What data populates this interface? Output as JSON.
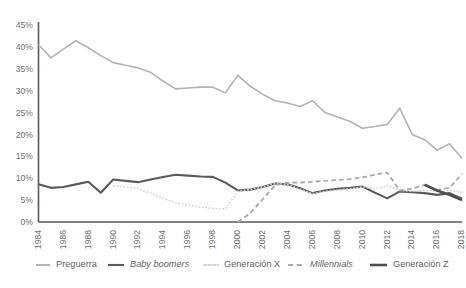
{
  "chart_data": {
    "type": "line",
    "title": "",
    "subtitle": "",
    "xlabel": "",
    "ylabel": "",
    "xlim": [
      1984,
      2018
    ],
    "ylim": [
      0,
      45
    ],
    "grid": false,
    "legend_position": "bottom",
    "y_ticks": [
      "0%",
      "5%",
      "10%",
      "15%",
      "20%",
      "25%",
      "30%",
      "35%",
      "40%",
      "45%"
    ],
    "y_tick_values": [
      0,
      5,
      10,
      15,
      20,
      25,
      30,
      35,
      40,
      45
    ],
    "x_ticks": [
      "1984",
      "1986",
      "1988",
      "1990",
      "1992",
      "1994",
      "1996",
      "1998",
      "2000",
      "2002",
      "2004",
      "2006",
      "2008",
      "2010",
      "2012",
      "2014",
      "2016",
      "2018"
    ],
    "x_tick_values": [
      1984,
      1986,
      1988,
      1990,
      1992,
      1994,
      1996,
      1998,
      2000,
      2002,
      2004,
      2006,
      2008,
      2010,
      2012,
      2014,
      2016,
      2018
    ],
    "series": [
      {
        "name": "Preguerra",
        "color": "#b3b3b3",
        "style": "solid",
        "width": 1.6,
        "italic": false,
        "x": [
          1984,
          1985,
          1986,
          1987,
          1988,
          1989,
          1990,
          1991,
          1992,
          1993,
          1994,
          1995,
          1996,
          1997,
          1998,
          1999,
          2000,
          2001,
          2002,
          2003,
          2004,
          2005,
          2006,
          2007,
          2008,
          2009,
          2010,
          2011,
          2012,
          2013,
          2014,
          2015,
          2016,
          2017,
          2018
        ],
        "values": [
          40.5,
          37.5,
          39.5,
          41.4,
          39.8,
          38.0,
          36.4,
          35.8,
          35.2,
          34.2,
          32.2,
          30.4,
          30.6,
          30.8,
          30.8,
          29.5,
          33.5,
          31.0,
          29.2,
          27.7,
          27.2,
          26.4,
          27.7,
          25.0,
          24.0,
          23.0,
          21.4,
          21.8,
          22.3,
          26.0,
          20.0,
          18.8,
          16.4,
          17.9,
          14.5
        ]
      },
      {
        "name": "Baby boomers",
        "color": "#5a5a5a",
        "style": "solid",
        "width": 2.1,
        "italic": true,
        "x": [
          1984,
          1985,
          1986,
          1987,
          1988,
          1989,
          1990,
          1991,
          1992,
          1993,
          1994,
          1995,
          1996,
          1997,
          1998,
          1999,
          2000,
          2001,
          2002,
          2003,
          2004,
          2005,
          2006,
          2007,
          2008,
          2009,
          2010,
          2011,
          2012,
          2013,
          2014,
          2015,
          2016,
          2017,
          2018
        ],
        "values": [
          8.6,
          7.8,
          8.0,
          8.6,
          9.2,
          6.7,
          9.7,
          9.4,
          9.1,
          9.7,
          10.3,
          10.8,
          10.6,
          10.4,
          10.3,
          9.0,
          7.2,
          7.4,
          8.0,
          8.8,
          8.6,
          7.7,
          6.6,
          7.2,
          7.6,
          7.8,
          8.1,
          6.7,
          5.4,
          7.0,
          6.8,
          6.6,
          6.2,
          6.6,
          5.3
        ]
      },
      {
        "name": "Generación X",
        "color": "#d2d2d2",
        "style": "dotted",
        "width": 1.5,
        "italic": false,
        "x": [
          1990,
          1991,
          1992,
          1993,
          1994,
          1995,
          1996,
          1997,
          1998,
          1999,
          2000,
          2001,
          2002,
          2003,
          2004,
          2005,
          2006,
          2007,
          2008,
          2009,
          2010,
          2011,
          2012,
          2013,
          2014,
          2015,
          2016,
          2017,
          2018
        ],
        "values": [
          8.3,
          8.0,
          7.6,
          6.6,
          5.4,
          4.4,
          3.9,
          3.4,
          3.1,
          3.0,
          7.0,
          7.4,
          8.0,
          8.8,
          8.6,
          7.5,
          6.5,
          7.0,
          7.3,
          7.6,
          8.0,
          7.6,
          8.3,
          7.2,
          7.0,
          7.2,
          7.0,
          7.2,
          6.8
        ]
      },
      {
        "name": "Millennials",
        "color": "#a8a8a8",
        "style": "dashed",
        "width": 1.8,
        "italic": true,
        "x": [
          2000,
          2001,
          2002,
          2003,
          2004,
          2005,
          2006,
          2007,
          2008,
          2009,
          2010,
          2011,
          2012,
          2013,
          2014,
          2015,
          2016,
          2017,
          2018
        ],
        "values": [
          0.0,
          2.0,
          5.2,
          8.4,
          9.0,
          9.0,
          9.2,
          9.4,
          9.6,
          9.8,
          10.2,
          10.8,
          11.3,
          7.2,
          7.6,
          8.5,
          7.3,
          7.8,
          11.0
        ]
      },
      {
        "name": "Generación Z",
        "color": "#4d4d4d",
        "style": "solid",
        "width": 2.6,
        "italic": false,
        "x": [
          2015,
          2016,
          2017,
          2018
        ],
        "values": [
          8.5,
          7.2,
          6.2,
          5.0
        ]
      }
    ]
  },
  "legend": {
    "items": [
      {
        "label": "Preguerra"
      },
      {
        "label": "Baby boomers"
      },
      {
        "label": "Generación X"
      },
      {
        "label": "Millennials"
      },
      {
        "label": "Generación Z"
      }
    ]
  },
  "axes": {
    "y_axis_color": "#595959",
    "x_axis_color": "#595959"
  }
}
